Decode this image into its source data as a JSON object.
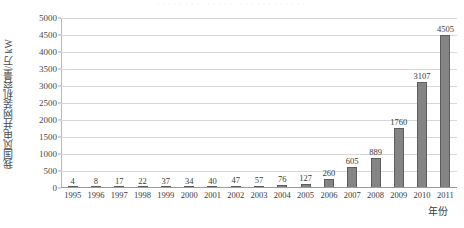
{
  "top_artifact": "········  ·····  ············",
  "colors": {
    "bar_fill": "#848484",
    "bar_border": "#5d5d5d",
    "gridline": "#d8d8d8",
    "axis": "#9a9a9a",
    "text": "#3a3a3a"
  },
  "chart_data": {
    "type": "bar",
    "title": "",
    "xlabel": "年份",
    "ylabel": "我国风电并网装机容量/万 kW",
    "ylim": [
      0,
      5000
    ],
    "yticks": [
      0,
      500,
      1000,
      1500,
      2000,
      2500,
      3000,
      3500,
      4000,
      4500,
      5000
    ],
    "ytick_labels": [
      "0",
      "500",
      "1000",
      "1500",
      "2000",
      "2500",
      "3000",
      "3500",
      "4000",
      "4500",
      "5000"
    ],
    "grid": true,
    "legend": false,
    "categories": [
      "1995",
      "1996",
      "1997",
      "1998",
      "1999",
      "2000",
      "2001",
      "2002",
      "2003",
      "2004",
      "2005",
      "2006",
      "2007",
      "2008",
      "2009",
      "2010",
      "2011"
    ],
    "values": [
      4,
      8,
      17,
      22,
      37,
      34,
      40,
      47,
      57,
      76,
      127,
      260,
      605,
      889,
      1760,
      3107,
      4505
    ],
    "data_labels": [
      "4",
      "8",
      "17",
      "22",
      "37",
      "34",
      "40",
      "47",
      "57",
      "76",
      "127",
      "260",
      "605",
      "889",
      "1760",
      "3107",
      "4505"
    ]
  }
}
